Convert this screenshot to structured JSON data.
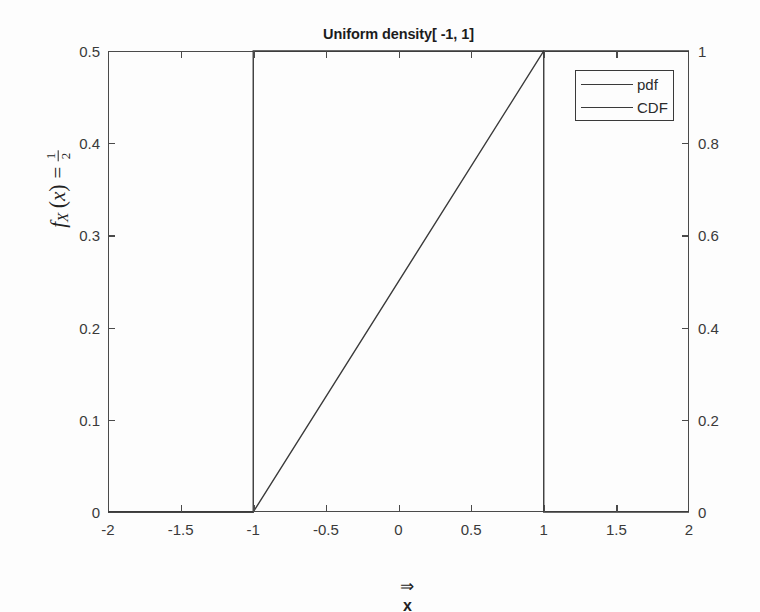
{
  "chart_data": {
    "type": "line",
    "title": "Uniform density[ -1, 1]",
    "xlabel": "⇒ x",
    "xlabel_arrow": "⇒",
    "xlabel_var": "x",
    "ylabel_left_parts": {
      "f": "f",
      "sub": "X",
      "open": "(",
      "var": "x",
      "close": ")",
      "equals": "=",
      "num": "1",
      "den": "2"
    },
    "ylabel_left_text": "f_X (x) = 1/2",
    "ylabel_right": "",
    "grid": false,
    "legend_position": "upper right",
    "xlim": [
      -2,
      2
    ],
    "ylim_left": [
      0,
      0.5
    ],
    "ylim_right": [
      0,
      1
    ],
    "xticks": [
      -2,
      -1.5,
      -1,
      -0.5,
      0,
      0.5,
      1,
      1.5,
      2
    ],
    "xticklabels": [
      "-2",
      "-1.5",
      "-1",
      "-0.5",
      "0",
      "0.5",
      "1",
      "1.5",
      "2"
    ],
    "yticks_left": [
      0,
      0.1,
      0.2,
      0.3,
      0.4,
      0.5
    ],
    "yticklabels_left": [
      "0",
      "0.1",
      "0.2",
      "0.3",
      "0.4",
      "0.5"
    ],
    "yticks_right": [
      0,
      0.2,
      0.4,
      0.6,
      0.8,
      1
    ],
    "yticklabels_right": [
      "0",
      "0.2",
      "0.4",
      "0.6",
      "0.8",
      "1"
    ],
    "series": [
      {
        "name": "pdf",
        "axis": "left",
        "color": "#3a3a3a",
        "x": [
          -2,
          -1,
          -1,
          1,
          1,
          2
        ],
        "y": [
          0,
          0,
          0.5,
          0.5,
          0,
          0
        ]
      },
      {
        "name": "CDF",
        "axis": "right",
        "color": "#3a3a3a",
        "x": [
          -2,
          -1,
          1,
          2
        ],
        "y": [
          0,
          0,
          1,
          1
        ]
      }
    ],
    "legend": [
      "pdf",
      "CDF"
    ]
  },
  "legend": {
    "items": [
      {
        "label": "pdf"
      },
      {
        "label": "CDF"
      }
    ]
  },
  "colors": {
    "axis": "#4a4a4a",
    "line": "#3a3a3a",
    "text": "#2b2b2b",
    "background": "#fdfdfd"
  }
}
